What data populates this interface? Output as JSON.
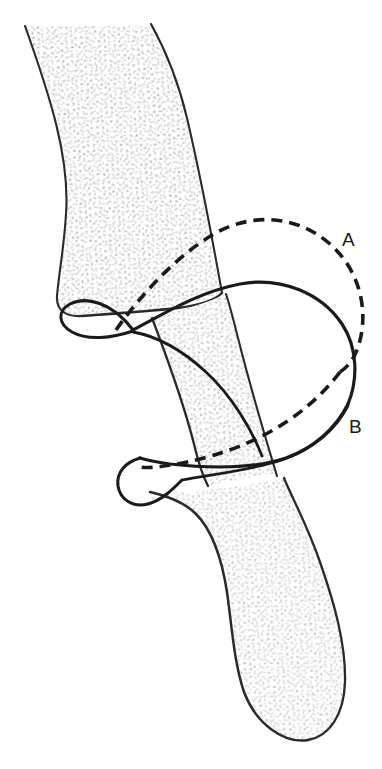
{
  "figure": {
    "type": "anatomical-line-drawing",
    "background_color": "#ffffff",
    "outline_color": "#1a1a1a",
    "stipple_color": "#9b9b9b",
    "bone": {
      "name": "bone-shaft-and-distal-end",
      "fill_color": "#fefefe",
      "outline_width": 2.2,
      "texture": "trabecular-stipple"
    },
    "loops": [
      {
        "id": "solid-loop",
        "name": "solid-band-loop",
        "style": "solid",
        "color": "#1a1a1a",
        "stroke_width": 3.2
      },
      {
        "id": "dashed-loop",
        "name": "dashed-band-loop",
        "style": "dashed",
        "color": "#1a1a1a",
        "stroke_width": 3.6,
        "dash_pattern": "11 7"
      }
    ],
    "labels": [
      {
        "id": "label-a",
        "text": "A",
        "x": 348,
        "y": 245,
        "refers_to": "dashed-loop"
      },
      {
        "id": "label-b",
        "text": "B",
        "x": 354,
        "y": 432,
        "refers_to": "solid-loop"
      }
    ]
  }
}
